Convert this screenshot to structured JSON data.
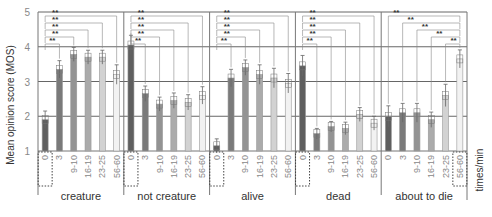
{
  "chart_data": {
    "type": "bar",
    "title": "",
    "ylabel": "Mean opinion score (MOS)",
    "xlabel": "times/min",
    "ylim": [
      1,
      5
    ],
    "yticks": [
      1,
      2,
      3,
      4,
      5
    ],
    "grid": true,
    "subcategories": [
      "0",
      "3",
      "9-10",
      "16-19",
      "23-25",
      "56-60"
    ],
    "groups": [
      {
        "name": "creature",
        "values": [
          1.9,
          3.35,
          3.78,
          3.7,
          3.7,
          3.2
        ],
        "errors": [
          0.25,
          0.25,
          0.2,
          0.2,
          0.2,
          0.28
        ],
        "reference_index": 0,
        "significance": [
          "**",
          "**",
          "**",
          "**",
          "**"
        ]
      },
      {
        "name": "not creature",
        "values": [
          4.05,
          2.65,
          2.35,
          2.45,
          2.4,
          2.6
        ],
        "errors": [
          0.28,
          0.22,
          0.2,
          0.22,
          0.22,
          0.25
        ],
        "reference_index": 0,
        "significance": [
          "**",
          "**",
          "**",
          "**",
          "**"
        ]
      },
      {
        "name": "alive",
        "values": [
          1.15,
          3.1,
          3.4,
          3.2,
          3.1,
          2.95
        ],
        "errors": [
          0.2,
          0.25,
          0.22,
          0.28,
          0.28,
          0.28
        ],
        "reference_index": 0,
        "significance": [
          "**",
          "**",
          "**",
          "**",
          "**"
        ]
      },
      {
        "name": "dead",
        "values": [
          3.45,
          1.5,
          1.7,
          1.65,
          2.05,
          1.8
        ],
        "errors": [
          0.3,
          0.15,
          0.15,
          0.18,
          0.2,
          0.2
        ],
        "reference_index": 0,
        "significance": [
          "**",
          "**",
          "**",
          "**",
          "**"
        ]
      },
      {
        "name": "about to die",
        "values": [
          2.0,
          2.1,
          2.1,
          1.9,
          2.6,
          3.65
        ],
        "errors": [
          0.3,
          0.27,
          0.27,
          0.22,
          0.32,
          0.26
        ],
        "reference_index": 5,
        "significance": [
          "**",
          "**",
          "**",
          "**",
          "**"
        ]
      }
    ],
    "bar_colors": [
      "#5f5f5f",
      "#7a7a7a",
      "#939393",
      "#ababab",
      "#d2d2d2",
      "#f2f2f2"
    ],
    "significance_label": "**"
  },
  "labels": {
    "ylabel": "Mean opinion score (MOS)",
    "xunit": "times/min"
  }
}
